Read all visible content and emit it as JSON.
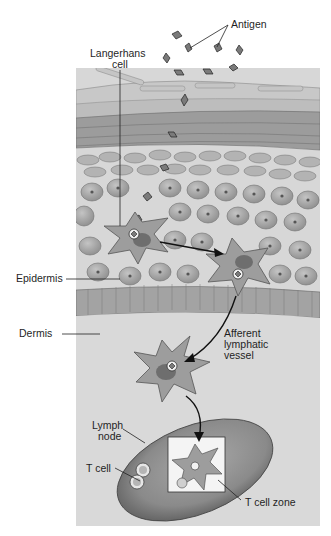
{
  "labels": {
    "antigen": "Antigen",
    "langerhans_line1": "Langerhans",
    "langerhans_line2": "cell",
    "epidermis": "Epidermis",
    "dermis": "Dermis",
    "afferent_line1": "Afferent",
    "afferent_line2": "lymphatic",
    "afferent_line3": "vessel",
    "lymph_node_line1": "Lymph",
    "lymph_node_line2": "node",
    "t_cell": "T cell",
    "t_cell_zone": "T cell zone"
  },
  "colors": {
    "background": "#ffffff",
    "panel": "#d7d7d7",
    "dermis": "#d9d9d9",
    "cell_fill": "#a9a9a9",
    "cell_stroke": "#6b6b6b",
    "antigen_fill": "#7a7a7a",
    "node_fill": "#8c8c8c",
    "arrow": "#111111"
  }
}
